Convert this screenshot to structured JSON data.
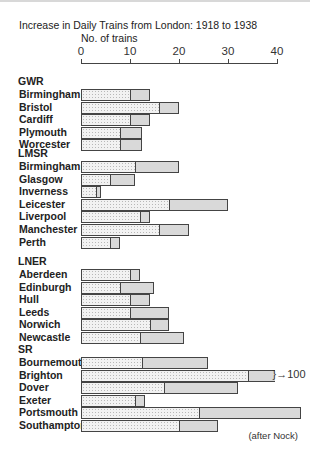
{
  "chart_data": {
    "type": "bar",
    "orientation": "horizontal",
    "stacked": true,
    "title": "Increase in Daily Trains from London: 1918 to 1938",
    "xlabel": "No. of trains",
    "ylabel": "",
    "xlim": [
      0,
      40
    ],
    "x_ticks": [
      "0",
      "10",
      "20",
      "30",
      "40"
    ],
    "grid": false,
    "legend": "none (light = 1918 trains, darker = increase to 1938)",
    "source": "(after Nock)",
    "groups": [
      {
        "name": "GWR",
        "categories": [
          {
            "name": "Birmingham",
            "trains_1918": 10,
            "trains_1938": 14
          },
          {
            "name": "Bristol",
            "trains_1918": 16,
            "trains_1938": 20
          },
          {
            "name": "Cardiff",
            "trains_1918": 10,
            "trains_1938": 14
          },
          {
            "name": "Plymouth",
            "trains_1918": 8,
            "trains_1938": 12.5
          },
          {
            "name": "Worcester",
            "trains_1918": 8,
            "trains_1938": 12.5
          }
        ]
      },
      {
        "name": "LMSR",
        "categories": [
          {
            "name": "Birmingham",
            "trains_1918": 11,
            "trains_1938": 20
          },
          {
            "name": "Glasgow",
            "trains_1918": 6,
            "trains_1938": 11
          },
          {
            "name": "Inverness",
            "trains_1918": 3,
            "trains_1938": 4
          },
          {
            "name": "Leicester",
            "trains_1918": 18,
            "trains_1938": 30
          },
          {
            "name": "Liverpool",
            "trains_1918": 12,
            "trains_1938": 14
          },
          {
            "name": "Manchester",
            "trains_1918": 16,
            "trains_1938": 22
          },
          {
            "name": "Perth",
            "trains_1918": 6,
            "trains_1938": 8
          }
        ]
      },
      {
        "name": "LNER",
        "categories": [
          {
            "name": "Aberdeen",
            "trains_1918": 10,
            "trains_1938": 12
          },
          {
            "name": "Edinburgh",
            "trains_1918": 8,
            "trains_1938": 15
          },
          {
            "name": "Hull",
            "trains_1918": 10,
            "trains_1938": 14
          },
          {
            "name": "Leeds",
            "trains_1918": 10,
            "trains_1938": 18
          },
          {
            "name": "Norwich",
            "trains_1918": 14,
            "trains_1938": 18
          },
          {
            "name": "Newcastle",
            "trains_1918": 12,
            "trains_1938": 21
          }
        ]
      },
      {
        "name": "SR",
        "categories": [
          {
            "name": "Bournemouth",
            "trains_1918": 12.5,
            "trains_1938": 26
          },
          {
            "name": "Brighton",
            "trains_1918": 34,
            "trains_1938": 100,
            "annotation": "100",
            "axis_break": true
          },
          {
            "name": "Dover",
            "trains_1918": 17,
            "trains_1938": 32
          },
          {
            "name": "Exeter",
            "trains_1918": 11,
            "trains_1938": 13
          },
          {
            "name": "Portsmouth",
            "trains_1918": 24,
            "trains_1938": 45
          },
          {
            "name": "Southampton",
            "trains_1918": 20,
            "trains_1938": 28
          }
        ]
      }
    ]
  }
}
